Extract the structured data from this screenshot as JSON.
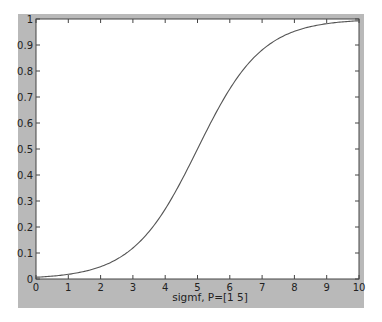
{
  "chart_data": {
    "type": "line",
    "title": "",
    "xlabel": "sigmf, P=[1 5]",
    "ylabel": "",
    "xlim": [
      0,
      10
    ],
    "ylim": [
      0,
      1
    ],
    "grid": false,
    "legend": null,
    "x_ticks": [
      "0",
      "1",
      "2",
      "3",
      "4",
      "5",
      "6",
      "7",
      "8",
      "9",
      "10"
    ],
    "y_ticks": [
      "0",
      "0.1",
      "0.2",
      "0.3",
      "0.4",
      "0.5",
      "0.6",
      "0.7",
      "0.8",
      "0.9",
      "1"
    ],
    "series": [
      {
        "name": "sigmf",
        "function": "1/(1+exp(-a*(x-c))), a=1, c=5",
        "x": [
          0,
          1,
          2,
          3,
          4,
          5,
          6,
          7,
          8,
          9,
          10
        ],
        "values": [
          0.007,
          0.018,
          0.047,
          0.119,
          0.269,
          0.5,
          0.731,
          0.881,
          0.953,
          0.982,
          0.993
        ]
      }
    ]
  },
  "colors": {
    "frame": "#b9b9b9",
    "axes_bg": "#ffffff",
    "line": "#555555"
  }
}
